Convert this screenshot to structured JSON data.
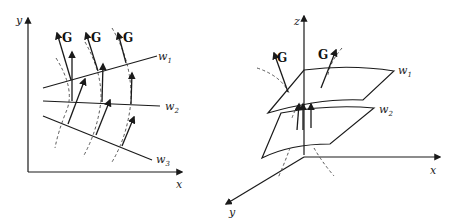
{
  "left_diagram": {
    "axes": {
      "x_label": "x",
      "y_label": "y"
    },
    "curve_labels": [
      "w",
      "w",
      "w"
    ],
    "curve_subscripts": [
      "1",
      "2",
      "3"
    ],
    "vector_labels": [
      "G",
      "G",
      "G"
    ]
  },
  "right_diagram": {
    "axes": {
      "x_label": "x",
      "y_label": "y",
      "z_label": "z"
    },
    "surface_labels": [
      "w",
      "w"
    ],
    "surface_subscripts": [
      "1",
      "2"
    ],
    "vector_labels": [
      "G",
      "G"
    ]
  }
}
